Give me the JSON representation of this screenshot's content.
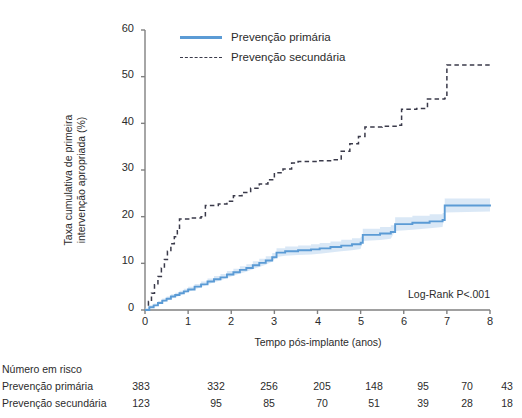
{
  "chart_data": {
    "type": "line",
    "title": "",
    "xlabel": "Tempo pós-implante (anos)",
    "ylabel": "Taxa cumulativa de primeira\nintervenção apropriada (%)",
    "xlim": [
      0,
      8
    ],
    "ylim": [
      0,
      60
    ],
    "xticks": [
      "0",
      "1",
      "2",
      "3",
      "4",
      "5",
      "6",
      "7",
      "8"
    ],
    "yticks": [
      "0",
      "10",
      "20",
      "30",
      "40",
      "50",
      "60"
    ],
    "grid": false,
    "legend_position": "top-center",
    "annotation": "Log-Rank P<.001",
    "colors": {
      "primary": "#5b9bd5",
      "secondary": "#3a3a4a"
    },
    "series": [
      {
        "name": "Prevenção primária",
        "style": "solid",
        "color": "#5b9bd5",
        "points": [
          [
            0.0,
            0.0
          ],
          [
            0.1,
            0.6
          ],
          [
            0.2,
            1.0
          ],
          [
            0.3,
            1.5
          ],
          [
            0.4,
            2.0
          ],
          [
            0.5,
            2.4
          ],
          [
            0.6,
            2.9
          ],
          [
            0.7,
            3.2
          ],
          [
            0.8,
            3.6
          ],
          [
            0.9,
            4.0
          ],
          [
            1.0,
            4.4
          ],
          [
            1.15,
            5.0
          ],
          [
            1.3,
            5.5
          ],
          [
            1.45,
            6.1
          ],
          [
            1.6,
            6.6
          ],
          [
            1.75,
            7.0
          ],
          [
            1.9,
            7.6
          ],
          [
            2.05,
            8.1
          ],
          [
            2.2,
            8.6
          ],
          [
            2.35,
            9.0
          ],
          [
            2.5,
            9.6
          ],
          [
            2.65,
            10.1
          ],
          [
            2.8,
            10.6
          ],
          [
            2.95,
            11.3
          ],
          [
            3.05,
            12.3
          ],
          [
            3.25,
            12.6
          ],
          [
            3.55,
            12.8
          ],
          [
            3.85,
            13.0
          ],
          [
            4.05,
            13.2
          ],
          [
            4.3,
            13.5
          ],
          [
            4.55,
            13.8
          ],
          [
            4.8,
            14.1
          ],
          [
            5.0,
            14.4
          ],
          [
            5.05,
            16.1
          ],
          [
            5.45,
            16.4
          ],
          [
            5.7,
            16.7
          ],
          [
            5.8,
            18.4
          ],
          [
            6.2,
            18.7
          ],
          [
            6.6,
            19.0
          ],
          [
            6.9,
            19.3
          ],
          [
            6.95,
            22.4
          ],
          [
            8.0,
            22.6
          ]
        ]
      },
      {
        "name": "Prevenção secundária",
        "style": "dashed",
        "color": "#3a3a4a",
        "points": [
          [
            0.0,
            0.0
          ],
          [
            0.08,
            1.8
          ],
          [
            0.15,
            3.6
          ],
          [
            0.22,
            5.4
          ],
          [
            0.3,
            7.2
          ],
          [
            0.38,
            9.0
          ],
          [
            0.45,
            10.8
          ],
          [
            0.52,
            12.6
          ],
          [
            0.6,
            14.2
          ],
          [
            0.68,
            15.7
          ],
          [
            0.75,
            17.0
          ],
          [
            0.8,
            19.5
          ],
          [
            1.1,
            19.7
          ],
          [
            1.3,
            20.0
          ],
          [
            1.4,
            22.4
          ],
          [
            1.7,
            22.7
          ],
          [
            1.9,
            23.3
          ],
          [
            2.05,
            24.5
          ],
          [
            2.25,
            25.2
          ],
          [
            2.45,
            26.1
          ],
          [
            2.65,
            27.0
          ],
          [
            2.85,
            27.9
          ],
          [
            3.0,
            29.4
          ],
          [
            3.2,
            30.2
          ],
          [
            3.4,
            31.5
          ],
          [
            3.55,
            31.8
          ],
          [
            4.0,
            32.0
          ],
          [
            4.35,
            32.2
          ],
          [
            4.55,
            34.0
          ],
          [
            4.75,
            35.6
          ],
          [
            4.95,
            37.2
          ],
          [
            5.1,
            39.2
          ],
          [
            5.5,
            39.4
          ],
          [
            5.85,
            39.6
          ],
          [
            5.95,
            43.0
          ],
          [
            6.3,
            43.2
          ],
          [
            6.55,
            45.2
          ],
          [
            6.95,
            45.4
          ],
          [
            7.0,
            52.5
          ],
          [
            8.0,
            52.6
          ]
        ]
      }
    ]
  },
  "legend": {
    "items": [
      {
        "label": "Prevenção primária",
        "style": "solid"
      },
      {
        "label": "Prevenção secundária",
        "style": "dashed"
      }
    ]
  },
  "risk_table": {
    "title": "Número em risco",
    "rows": [
      {
        "label": "Prevenção primária",
        "values": [
          "383",
          "332",
          "256",
          "205",
          "148",
          "95",
          "70",
          "43"
        ]
      },
      {
        "label": "Prevenção secundária",
        "values": [
          "123",
          "95",
          "85",
          "70",
          "51",
          "39",
          "28",
          "18"
        ]
      }
    ]
  }
}
